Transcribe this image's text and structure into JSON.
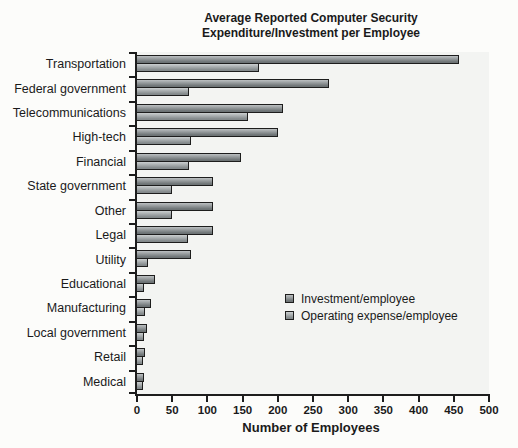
{
  "figure": {
    "title_line1": "Average Reported Computer Security",
    "title_line2": "Expenditure/Investment per Employee",
    "xlabel": "Number of Employees"
  },
  "legend": {
    "position": "inside-plot-lower-right",
    "items": [
      {
        "label": "Investment/employee"
      },
      {
        "label": "Operating expense/employee"
      }
    ]
  },
  "colors": {
    "investment_top": "#bcc0c2",
    "investment_bottom": "#6d7375",
    "operating_top": "#cbcfd0",
    "operating_bottom": "#83898b",
    "bar_border": "#1d1d1d",
    "plot_background": "#f3f4f2",
    "page_background": "#fcfcfa",
    "text": "#1a1a1a"
  },
  "chart_data": {
    "type": "bar",
    "orientation": "horizontal",
    "title": "Average Reported Computer Security Expenditure/Investment per Employee",
    "xlabel": "Number of Employees",
    "ylabel": "",
    "xlim": [
      0,
      500
    ],
    "x_ticks": [
      0,
      50,
      100,
      150,
      200,
      250,
      300,
      350,
      400,
      450,
      500
    ],
    "grid": false,
    "legend_position": "inside-right-lower",
    "categories": [
      "Transportation",
      "Federal government",
      "Telecommunications",
      "High-tech",
      "Financial",
      "State government",
      "Other",
      "Legal",
      "Utility",
      "Educational",
      "Manufacturing",
      "Local government",
      "Retail",
      "Medical"
    ],
    "series": [
      {
        "name": "Investment/employee",
        "values": [
          458,
          273,
          208,
          200,
          148,
          108,
          108,
          108,
          77,
          25,
          20,
          14,
          12,
          10
        ]
      },
      {
        "name": "Operating expense/employee",
        "values": [
          173,
          74,
          157,
          77,
          74,
          50,
          50,
          72,
          15,
          10,
          12,
          10,
          9,
          8
        ]
      }
    ]
  }
}
